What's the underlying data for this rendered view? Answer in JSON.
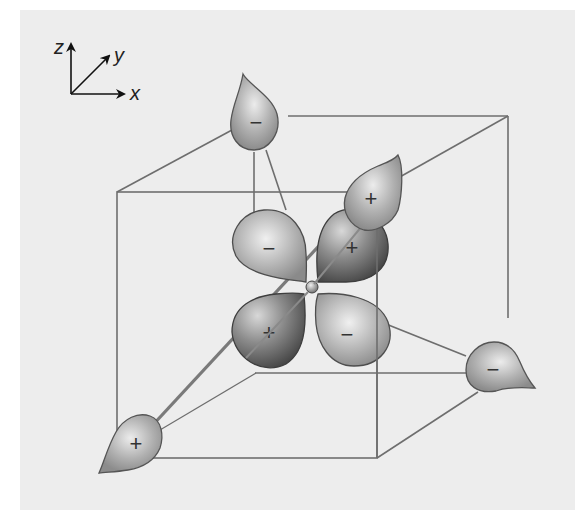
{
  "diagram": {
    "type": "d-orbital in cubic (tetrahedral) ligand field",
    "axes": {
      "z_label": "z",
      "y_label": "y",
      "x_label": "x"
    },
    "ligands": [
      {
        "position": "back-top-left",
        "sign": "−"
      },
      {
        "position": "back-top-right",
        "sign": "+"
      },
      {
        "position": "back-bottom-right",
        "sign": "−"
      },
      {
        "position": "front-bottom-left",
        "sign": "+"
      }
    ],
    "orbital_lobes": [
      {
        "position": "upper-left",
        "sign": "−"
      },
      {
        "position": "upper-right",
        "sign": "+"
      },
      {
        "position": "lower-left",
        "sign": "+"
      },
      {
        "position": "lower-right",
        "sign": "−"
      }
    ],
    "colors": {
      "background": "#ededed",
      "cube_edge": "#6e6e6e",
      "lobe_light": "#e2e2e2",
      "lobe_mid": "#a9a9a9",
      "lobe_dark": "#4a4a4a"
    }
  }
}
